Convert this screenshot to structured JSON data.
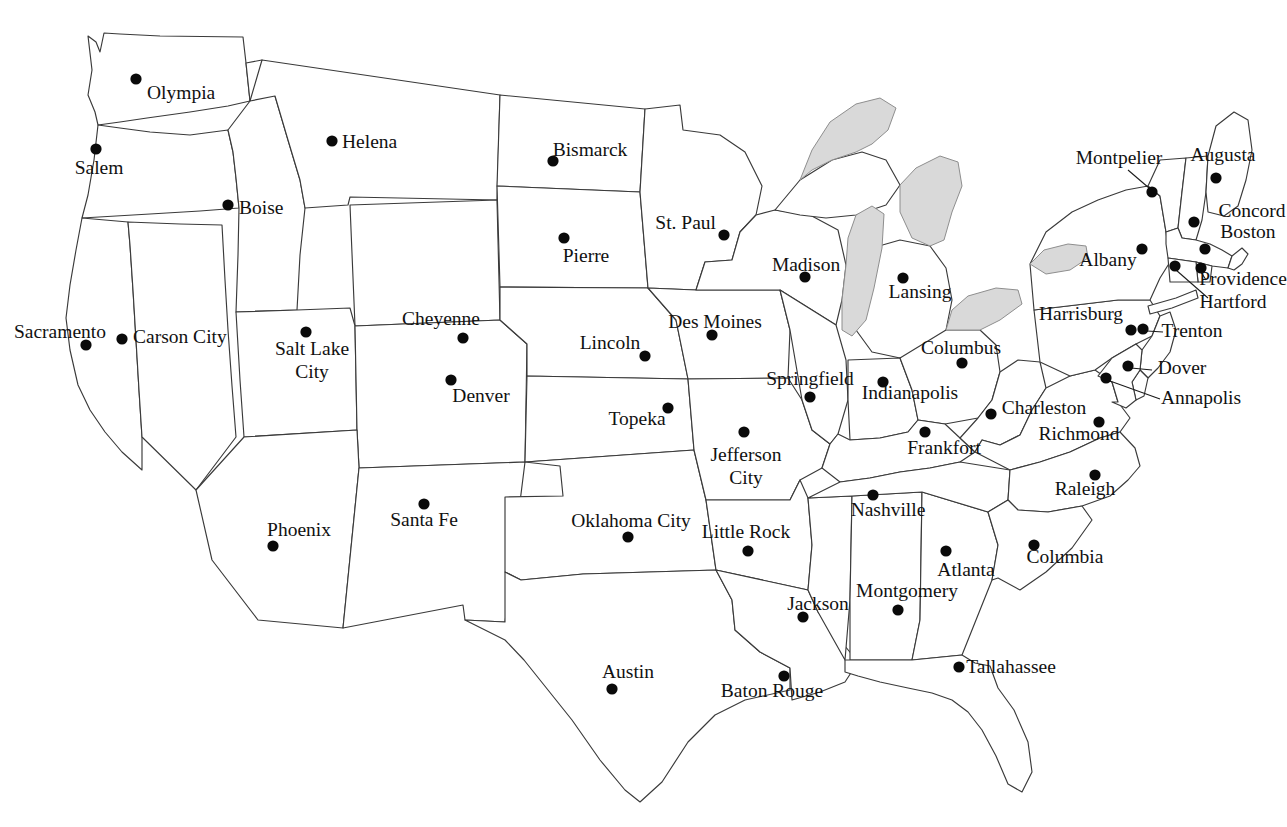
{
  "page": {
    "title_clipped": "Map of the United States",
    "background_color": "#ffffff",
    "outline_color": "#3a3a3a",
    "lake_fill_color": "#d9d9d9",
    "dot_color": "#0a0a0a",
    "label_color": "#111111",
    "width": 1287,
    "height": 827
  },
  "map": {
    "name": "united-states-capitals-map",
    "description": "Outline map of the contiguous United States with state borders, the Great Lakes shaded gray, and a labeled dot marking each state capital.",
    "lakes": [
      {
        "name": "lake-superior"
      },
      {
        "name": "lake-michigan"
      },
      {
        "name": "lake-huron"
      },
      {
        "name": "lake-erie"
      },
      {
        "name": "lake-ontario"
      }
    ],
    "capitals": [
      {
        "label": "Olympia",
        "dot_x": 136,
        "dot_y": 79,
        "label_x": 147,
        "label_y": 99,
        "anchor": "start",
        "leader": null
      },
      {
        "label": "Salem",
        "dot_x": 96,
        "dot_y": 149,
        "label_x": 99,
        "label_y": 174,
        "anchor": "middle",
        "leader": null
      },
      {
        "label": "Boise",
        "dot_x": 228,
        "dot_y": 205,
        "label_x": 239,
        "label_y": 214,
        "anchor": "start",
        "leader": null
      },
      {
        "label": "Helena",
        "dot_x": 332,
        "dot_y": 141,
        "label_x": 342,
        "label_y": 148,
        "anchor": "start",
        "leader": null
      },
      {
        "label": "Bismarck",
        "dot_x": 553,
        "dot_y": 161,
        "label_x": 590,
        "label_y": 156,
        "anchor": "middle",
        "leader": null
      },
      {
        "label": "Pierre",
        "dot_x": 564,
        "dot_y": 238,
        "label_x": 586,
        "label_y": 262,
        "anchor": "middle",
        "leader": null
      },
      {
        "label": "St. Paul",
        "dot_x": 724,
        "dot_y": 235,
        "label_x": 716,
        "label_y": 229,
        "anchor": "end",
        "leader": null
      },
      {
        "label": "Madison",
        "dot_x": 805,
        "dot_y": 277,
        "label_x": 806,
        "label_y": 271,
        "anchor": "middle",
        "leader": null
      },
      {
        "label": "Lansing",
        "dot_x": 903,
        "dot_y": 278,
        "label_x": 920,
        "label_y": 298,
        "anchor": "middle",
        "leader": null
      },
      {
        "label": "Des Moines",
        "dot_x": 712,
        "dot_y": 335,
        "label_x": 715,
        "label_y": 328,
        "anchor": "middle",
        "leader": null
      },
      {
        "label": "Lincoln",
        "dot_x": 645,
        "dot_y": 356,
        "label_x": 610,
        "label_y": 349,
        "anchor": "middle",
        "leader": null
      },
      {
        "label": "Cheyenne",
        "dot_x": 463,
        "dot_y": 338,
        "label_x": 441,
        "label_y": 325,
        "anchor": "middle",
        "leader": null
      },
      {
        "label": "Salt Lake\nCity",
        "dot_x": 306,
        "dot_y": 332,
        "label_x": 312,
        "label_y": 355,
        "anchor": "middle",
        "leader": null
      },
      {
        "label": "Denver",
        "dot_x": 451,
        "dot_y": 380,
        "label_x": 481,
        "label_y": 402,
        "anchor": "middle",
        "leader": null
      },
      {
        "label": "Topeka",
        "dot_x": 668,
        "dot_y": 408,
        "label_x": 637,
        "label_y": 425,
        "anchor": "middle",
        "leader": null
      },
      {
        "label": "Sacramento",
        "dot_x": 86,
        "dot_y": 345,
        "label_x": 60,
        "label_y": 338,
        "anchor": "middle",
        "leader": null
      },
      {
        "label": "Carson City",
        "dot_x": 122,
        "dot_y": 339,
        "label_x": 133,
        "label_y": 343,
        "anchor": "start",
        "leader": null
      },
      {
        "label": "Springfield",
        "dot_x": 810,
        "dot_y": 397,
        "label_x": 810,
        "label_y": 385,
        "anchor": "middle",
        "leader": null
      },
      {
        "label": "Indianapolis",
        "dot_x": 883,
        "dot_y": 382,
        "label_x": 910,
        "label_y": 399,
        "anchor": "middle",
        "leader": null
      },
      {
        "label": "Columbus",
        "dot_x": 962,
        "dot_y": 363,
        "label_x": 961,
        "label_y": 354,
        "anchor": "middle",
        "leader": null
      },
      {
        "label": "Jefferson\nCity",
        "dot_x": 744,
        "dot_y": 432,
        "label_x": 746,
        "label_y": 461,
        "anchor": "middle",
        "leader": null
      },
      {
        "label": "Frankfort",
        "dot_x": 925,
        "dot_y": 432,
        "label_x": 944,
        "label_y": 454,
        "anchor": "middle",
        "leader": null
      },
      {
        "label": "Charleston",
        "dot_x": 991,
        "dot_y": 414,
        "label_x": 1044,
        "label_y": 414,
        "anchor": "middle",
        "leader": null
      },
      {
        "label": "Richmond",
        "dot_x": 1099,
        "dot_y": 422,
        "label_x": 1079,
        "label_y": 440,
        "anchor": "middle",
        "leader": null
      },
      {
        "label": "Raleigh",
        "dot_x": 1095,
        "dot_y": 475,
        "label_x": 1085,
        "label_y": 495,
        "anchor": "middle",
        "leader": null
      },
      {
        "label": "Nashville",
        "dot_x": 873,
        "dot_y": 495,
        "label_x": 888,
        "label_y": 516,
        "anchor": "middle",
        "leader": null
      },
      {
        "label": "Columbia",
        "dot_x": 1034,
        "dot_y": 545,
        "label_x": 1065,
        "label_y": 563,
        "anchor": "middle",
        "leader": null
      },
      {
        "label": "Atlanta",
        "dot_x": 946,
        "dot_y": 551,
        "label_x": 966,
        "label_y": 576,
        "anchor": "middle",
        "leader": null
      },
      {
        "label": "Montgomery",
        "dot_x": 898,
        "dot_y": 610,
        "label_x": 907,
        "label_y": 597,
        "anchor": "middle",
        "leader": null
      },
      {
        "label": "Jackson",
        "dot_x": 803,
        "dot_y": 617,
        "label_x": 818,
        "label_y": 610,
        "anchor": "middle",
        "leader": null
      },
      {
        "label": "Little Rock",
        "dot_x": 748,
        "dot_y": 551,
        "label_x": 746,
        "label_y": 538,
        "anchor": "middle",
        "leader": null
      },
      {
        "label": "Oklahoma City",
        "dot_x": 628,
        "dot_y": 537,
        "label_x": 631,
        "label_y": 527,
        "anchor": "middle",
        "leader": null
      },
      {
        "label": "Santa Fe",
        "dot_x": 424,
        "dot_y": 504,
        "label_x": 424,
        "label_y": 526,
        "anchor": "middle",
        "leader": null
      },
      {
        "label": "Phoenix",
        "dot_x": 273,
        "dot_y": 546,
        "label_x": 299,
        "label_y": 536,
        "anchor": "middle",
        "leader": null
      },
      {
        "label": "Austin",
        "dot_x": 612,
        "dot_y": 689,
        "label_x": 628,
        "label_y": 678,
        "anchor": "middle",
        "leader": null
      },
      {
        "label": "Baton Rouge",
        "dot_x": 784,
        "dot_y": 676,
        "label_x": 772,
        "label_y": 697,
        "anchor": "middle",
        "leader": null
      },
      {
        "label": "Tallahassee",
        "dot_x": 959,
        "dot_y": 667,
        "label_x": 1011,
        "label_y": 673,
        "anchor": "middle",
        "leader": null
      },
      {
        "label": "Montpelier",
        "dot_x": 1152,
        "dot_y": 192,
        "label_x": 1119,
        "label_y": 164,
        "anchor": "middle",
        "leader": {
          "x1": 1149,
          "y1": 188,
          "x2": 1128,
          "y2": 170
        }
      },
      {
        "label": "Augusta",
        "dot_x": 1216,
        "dot_y": 178,
        "label_x": 1223,
        "label_y": 161,
        "anchor": "middle",
        "leader": null
      },
      {
        "label": "Concord",
        "dot_x": 1194,
        "dot_y": 222,
        "label_x": 1252,
        "label_y": 217,
        "anchor": "middle",
        "leader": null
      },
      {
        "label": "Boston",
        "dot_x": 1205,
        "dot_y": 249,
        "label_x": 1248,
        "label_y": 238,
        "anchor": "middle",
        "leader": null
      },
      {
        "label": "Albany",
        "dot_x": 1142,
        "dot_y": 249,
        "label_x": 1108,
        "label_y": 266,
        "anchor": "middle",
        "leader": null
      },
      {
        "label": "Providence",
        "dot_x": 1201,
        "dot_y": 268,
        "label_x": 1243,
        "label_y": 285,
        "anchor": "middle",
        "leader": {
          "x1": 1201,
          "y1": 272,
          "x2": 1206,
          "y2": 280
        }
      },
      {
        "label": "Hartford",
        "dot_x": 1175,
        "dot_y": 266,
        "label_x": 1233,
        "label_y": 308,
        "anchor": "middle",
        "leader": {
          "x1": 1176,
          "y1": 270,
          "x2": 1208,
          "y2": 298
        }
      },
      {
        "label": "Harrisburg",
        "dot_x": 1131,
        "dot_y": 330,
        "label_x": 1081,
        "label_y": 320,
        "anchor": "middle",
        "leader": null
      },
      {
        "label": "Trenton",
        "dot_x": 1143,
        "dot_y": 329,
        "label_x": 1192,
        "label_y": 337,
        "anchor": "middle",
        "leader": {
          "x1": 1147,
          "y1": 331,
          "x2": 1163,
          "y2": 332
        }
      },
      {
        "label": "Dover",
        "dot_x": 1128,
        "dot_y": 366,
        "label_x": 1182,
        "label_y": 374,
        "anchor": "middle",
        "leader": {
          "x1": 1131,
          "y1": 368,
          "x2": 1152,
          "y2": 370
        }
      },
      {
        "label": "Annapolis",
        "dot_x": 1106,
        "dot_y": 378,
        "label_x": 1201,
        "label_y": 404,
        "anchor": "middle",
        "leader": {
          "x1": 1110,
          "y1": 381,
          "x2": 1160,
          "y2": 399
        }
      }
    ]
  }
}
